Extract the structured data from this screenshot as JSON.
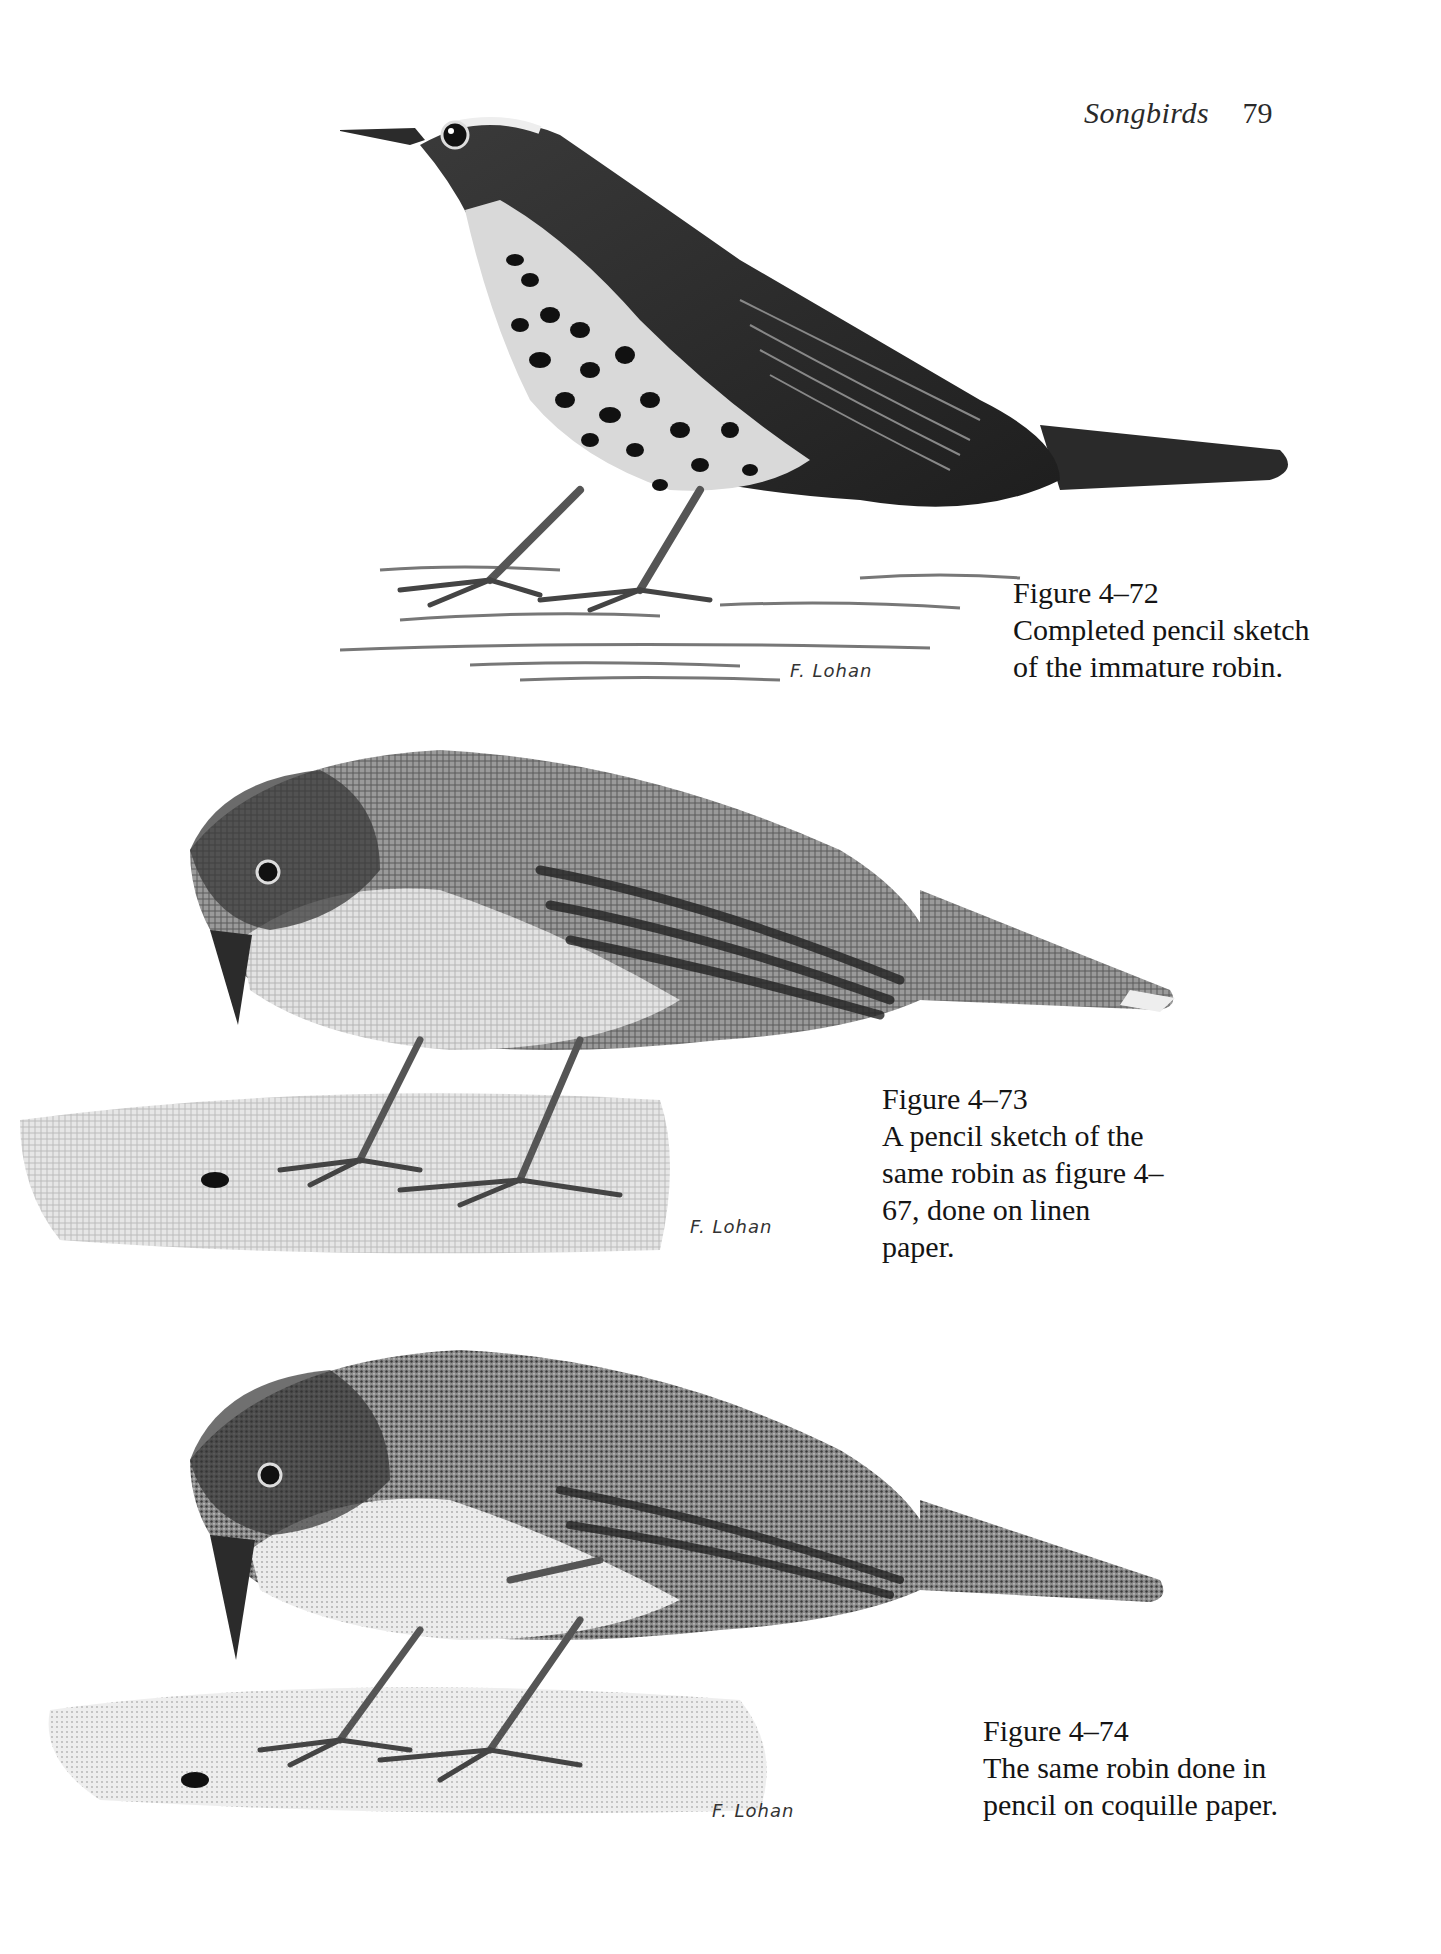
{
  "running_head": {
    "section_title": "Songbirds",
    "page_number": "79"
  },
  "figures": [
    {
      "id": "4-72",
      "label": "Figure 4–72",
      "caption_lines": [
        "Completed pencil sketch",
        "of the immature robin."
      ],
      "signature": "F. Lohan",
      "illustration": "pencil-sketch-immature-robin-standing-spotted-breast"
    },
    {
      "id": "4-73",
      "label": "Figure 4–73",
      "caption_lines": [
        "A pencil sketch of the",
        "same robin as figure 4–",
        "67, done on linen",
        "paper."
      ],
      "signature": "F. Lohan",
      "illustration": "pencil-sketch-robin-on-linen-paper-looking-at-insect"
    },
    {
      "id": "4-74",
      "label": "Figure 4–74",
      "caption_lines": [
        "The same robin done in",
        "pencil on coquille paper."
      ],
      "signature": "F. Lohan",
      "illustration": "pencil-sketch-robin-on-coquille-paper-looking-at-insect"
    }
  ],
  "colors": {
    "paper": "#ffffff",
    "ink": "#141414",
    "graphite_dark": "#2b2b2b",
    "graphite_mid": "#6e6e6e",
    "graphite_light": "#b8b8b8"
  }
}
